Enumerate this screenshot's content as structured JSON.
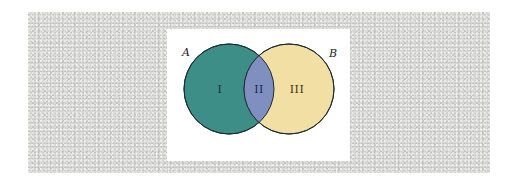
{
  "diagram": {
    "type": "venn",
    "sets": [
      {
        "label": "A",
        "color": "#3d8e86",
        "center": [
          62,
          60
        ],
        "radius": 45
      },
      {
        "label": "B",
        "color": "#f2dfa4",
        "center": [
          122,
          60
        ],
        "radius": 45
      }
    ],
    "intersection_color": "#7f8fc0",
    "stroke_color": "#1e2b33",
    "regions": [
      {
        "label": "I",
        "description": "A only",
        "text_color": "#1d2e2c"
      },
      {
        "label": "II",
        "description": "A and B",
        "text_color": "#1c2646"
      },
      {
        "label": "III",
        "description": "B only",
        "text_color": "#3b3320"
      }
    ]
  },
  "colors": {
    "background_texture": "#d8d8d6",
    "panel": "#ffffff"
  }
}
